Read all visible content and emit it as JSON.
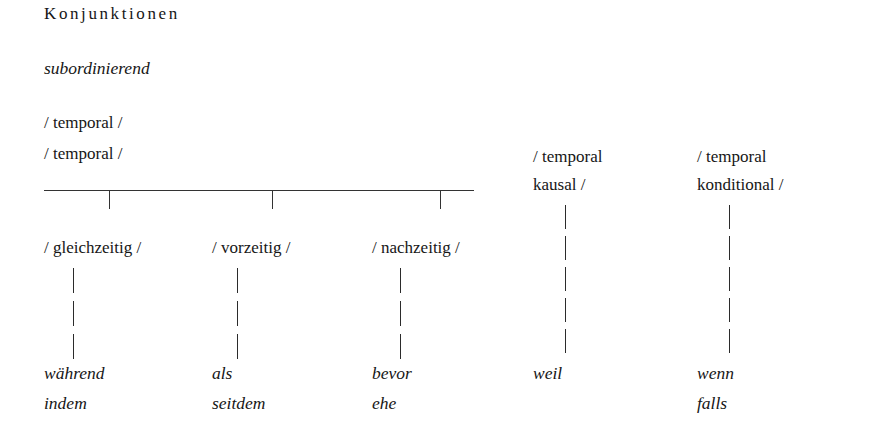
{
  "figure": {
    "title": "Konjunktionen",
    "subtitle": "subordinierend",
    "root_feature_line_1": "/ temporal /",
    "root_feature_line_2": "/ temporal /"
  },
  "temporal_branches": [
    {
      "feature": "/ gleichzeitig /",
      "examples_line_1": "während",
      "examples_line_2": "indem"
    },
    {
      "feature": "/ vorzeitig /",
      "examples_line_1": "als",
      "examples_line_2": "seitdem"
    },
    {
      "feature": "/ nachzeitig /",
      "examples_line_1": "bevor",
      "examples_line_2": "ehe"
    }
  ],
  "other_branches": [
    {
      "feature_line_1": "/ temporal",
      "feature_line_2": "kausal /",
      "examples_line_1": "weil",
      "examples_line_2": ""
    },
    {
      "feature_line_1": "/ temporal",
      "feature_line_2": "konditional /",
      "examples_line_1": "wenn",
      "examples_line_2": "falls"
    }
  ],
  "colors": {
    "background": "#ffffff",
    "text": "#161616",
    "rule": "#333333"
  }
}
